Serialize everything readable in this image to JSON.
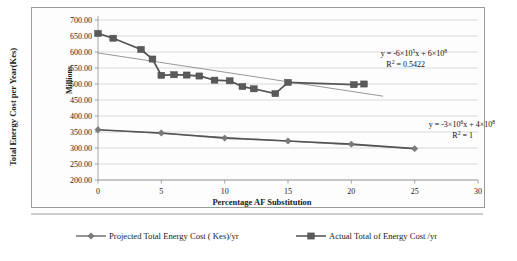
{
  "chart_data": {
    "type": "line",
    "title": "",
    "xlabel": "Percentage AF Substitution",
    "ylabel": "Total Energy Cost per Year(Kes)",
    "y_unit_label": "Millions",
    "xlim": [
      0,
      30
    ],
    "ylim": [
      200,
      700
    ],
    "x_ticks": [
      "0",
      "5",
      "10",
      "15",
      "20",
      "25",
      "30"
    ],
    "x_tick_values": [
      0,
      5,
      10,
      15,
      20,
      25,
      30
    ],
    "y_ticks": [
      "200.00",
      "250.00",
      "300.00",
      "350.00",
      "400.00",
      "450.00",
      "500.00",
      "550.00",
      "600.00",
      "650.00",
      "700.00"
    ],
    "y_tick_values": [
      200,
      250,
      300,
      350,
      400,
      450,
      500,
      550,
      600,
      650,
      700
    ],
    "grid": "horizontal",
    "legend_position": "bottom",
    "series": [
      {
        "name": "Projected Total Energy  Cost ( Kes)/yr",
        "marker": "diamond",
        "color": "#7b7b7b",
        "x": [
          0,
          5,
          10,
          15,
          20,
          25
        ],
        "values": [
          357,
          347,
          331,
          322,
          312,
          298
        ]
      },
      {
        "name": "Actual Total of Energy Cost /yr",
        "marker": "square",
        "color": "#5a5a5a",
        "x": [
          0,
          1.2,
          3.4,
          4.3,
          5.0,
          6.0,
          7.0,
          8.0,
          9.2,
          10.4,
          11.4,
          12.3,
          14.0,
          15.0,
          20.2,
          21.0
        ],
        "values": [
          658,
          643,
          608,
          578,
          527,
          529,
          528,
          525,
          512,
          510,
          492,
          485,
          470,
          505,
          498,
          500
        ]
      }
    ],
    "trendlines": [
      {
        "for_series": "Actual Total of Energy Cost /yr",
        "equation": "y = -6×10⁵x + 6×10⁸",
        "equation_parts": {
          "lhs": "y = -6×10",
          "exp1": "5",
          "mid": "x + 6×10",
          "exp2": "8"
        },
        "r2": "R² = 0.5422",
        "r2_parts": {
          "label": "R",
          "sup": "2",
          "value": " = 0.5422"
        },
        "x_start": 0,
        "y_start": 597,
        "x_end": 22.5,
        "y_end": 462
      },
      {
        "for_series": "Projected Total Energy  Cost ( Kes)/yr",
        "equation": "y = -3×10⁶x + 4×10⁸",
        "equation_parts": {
          "lhs": "y = -3×10",
          "exp1": "6",
          "mid": "x + 4×10",
          "exp2": "8"
        },
        "r2": "R² = 1",
        "r2_parts": {
          "label": "R",
          "sup": "2",
          "value": " = 1"
        },
        "x_start": 0,
        "y_start": 357,
        "x_end": 25,
        "y_end": 298
      }
    ],
    "annotations": [
      {
        "id": "eq-actual",
        "line1": "y = -6×10⁵x + 6×10⁸",
        "line2": "R² = 0.5422"
      },
      {
        "id": "eq-projected",
        "line1": "y = -3×10⁶x + 4×10⁸",
        "line2": "R² = 1"
      }
    ],
    "legend": [
      {
        "label": "Projected Total Energy  Cost ( Kes)/yr",
        "marker": "diamond",
        "color": "#7b7b7b"
      },
      {
        "label": "Actual Total of Energy Cost /yr",
        "marker": "square",
        "color": "#5a5a5a"
      }
    ]
  }
}
